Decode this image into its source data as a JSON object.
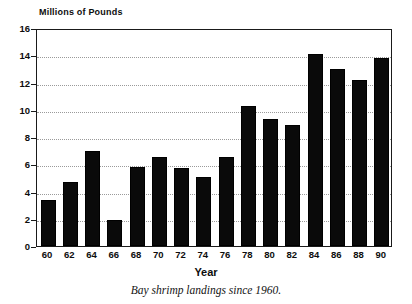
{
  "chart_data": {
    "type": "bar",
    "title": "",
    "xlabel": "Year",
    "ylabel": "Millions of Pounds",
    "caption": "Bay shrimp landings since 1960.",
    "categories": [
      "60",
      "62",
      "64",
      "66",
      "68",
      "70",
      "72",
      "74",
      "76",
      "78",
      "80",
      "82",
      "84",
      "86",
      "88",
      "90"
    ],
    "values": [
      3.4,
      4.7,
      7.0,
      1.9,
      5.8,
      6.5,
      5.7,
      5.1,
      6.5,
      10.3,
      9.3,
      8.9,
      14.1,
      13.0,
      12.2,
      13.8
    ],
    "ylim": [
      0,
      16
    ],
    "ytick_labels": [
      "16",
      "14",
      "12",
      "10",
      "8",
      "6",
      "4",
      "2",
      "0"
    ],
    "ytick_values": [
      16,
      14,
      12,
      10,
      8,
      6,
      4,
      2,
      0
    ],
    "ytick_step": 2,
    "grid": true,
    "grid_axis": "y",
    "grid_style": "dotted",
    "legend": false,
    "bar_color": "#0a0a0a",
    "axis_color": "#1a1a1a",
    "grid_color": "#9a9a9a",
    "background_color": "#ffffff"
  }
}
